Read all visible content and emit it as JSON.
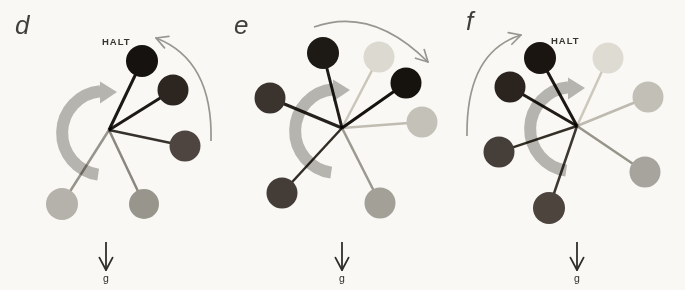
{
  "labels": {
    "halt": "HALT",
    "gravity": "g"
  },
  "colors": {
    "background": "#f9f8f4",
    "thick_rotation_arrow": "#b6b4ae",
    "thin_swing_arrow": "#98968f",
    "gravity_arrow": "#2f2e2a",
    "text": "#3b3a36"
  },
  "panels": [
    {
      "label": "d",
      "halt_shown": true,
      "rotation": "clockwise",
      "hub": {
        "x": 109,
        "y": 130
      },
      "thin_arrow": {
        "x1": 211,
        "y1": 141,
        "cx": 213,
        "cy": 60,
        "x2": 156,
        "y2": 38
      },
      "gravity_arrow_x": 106,
      "balls": [
        {
          "x": 142,
          "y": 61,
          "r": 16,
          "fill": "#15120f",
          "spoke": "#1b1815",
          "sw": 3
        },
        {
          "x": 173,
          "y": 90,
          "r": 15.5,
          "fill": "#2c2520",
          "spoke": "#1d1a16",
          "sw": 3
        },
        {
          "x": 185,
          "y": 146,
          "r": 15.5,
          "fill": "#4e4540",
          "spoke": "#38322d",
          "sw": 2.5
        },
        {
          "x": 144,
          "y": 204,
          "r": 15,
          "fill": "#98958d",
          "spoke": "#8e8b84",
          "sw": 2.5
        },
        {
          "x": 62,
          "y": 204,
          "r": 16,
          "fill": "#b5b2ab",
          "spoke": "#9b9891",
          "sw": 2.5
        }
      ]
    },
    {
      "label": "e",
      "halt_shown": false,
      "rotation": "clockwise",
      "hub": {
        "x": 342,
        "y": 128
      },
      "thin_arrow": {
        "x1": 314,
        "y1": 27,
        "cx": 372,
        "cy": 6,
        "x2": 428,
        "y2": 62
      },
      "gravity_arrow_x": 342,
      "balls": [
        {
          "x": 323,
          "y": 53,
          "r": 16,
          "fill": "#1d1915",
          "spoke": "#1f1b17",
          "sw": 3
        },
        {
          "x": 379,
          "y": 57,
          "r": 15.5,
          "fill": "#dcd9d0",
          "spoke": "#cfccc3",
          "sw": 2.5
        },
        {
          "x": 406,
          "y": 83,
          "r": 15.5,
          "fill": "#16120e",
          "spoke": "#16130f",
          "sw": 3
        },
        {
          "x": 270,
          "y": 98,
          "r": 15.5,
          "fill": "#3b332d",
          "spoke": "#27221d",
          "sw": 3
        },
        {
          "x": 422,
          "y": 122,
          "r": 15.5,
          "fill": "#c4c1b9",
          "spoke": "#c5c2ba",
          "sw": 2.5
        },
        {
          "x": 282,
          "y": 193,
          "r": 15.5,
          "fill": "#443c36",
          "spoke": "#322d27",
          "sw": 2.5
        },
        {
          "x": 380,
          "y": 203,
          "r": 15.5,
          "fill": "#a3a098",
          "spoke": "#a09d95",
          "sw": 2.5
        }
      ]
    },
    {
      "label": "f",
      "halt_shown": true,
      "rotation": "clockwise",
      "hub": {
        "x": 577,
        "y": 126
      },
      "thin_arrow": {
        "x1": 467,
        "y1": 136,
        "cx": 466,
        "cy": 52,
        "x2": 521,
        "y2": 35
      },
      "gravity_arrow_x": 577,
      "balls": [
        {
          "x": 540,
          "y": 58,
          "r": 16,
          "fill": "#1a1511",
          "spoke": "#1c1713",
          "sw": 3
        },
        {
          "x": 608,
          "y": 58,
          "r": 15.5,
          "fill": "#dedbd2",
          "spoke": "#d1cec5",
          "sw": 2.5
        },
        {
          "x": 510,
          "y": 87,
          "r": 15.5,
          "fill": "#2a231e",
          "spoke": "#201b16",
          "sw": 3
        },
        {
          "x": 648,
          "y": 97,
          "r": 15.5,
          "fill": "#c2bfb7",
          "spoke": "#c3c0b8",
          "sw": 2.5
        },
        {
          "x": 499,
          "y": 152,
          "r": 15.5,
          "fill": "#463e38",
          "spoke": "#353027",
          "sw": 2.5
        },
        {
          "x": 645,
          "y": 172,
          "r": 15.5,
          "fill": "#a6a49c",
          "spoke": "#9b9890",
          "sw": 2.5
        },
        {
          "x": 549,
          "y": 208,
          "r": 16,
          "fill": "#4c443d",
          "spoke": "#3e3832",
          "sw": 2.5
        }
      ]
    }
  ]
}
